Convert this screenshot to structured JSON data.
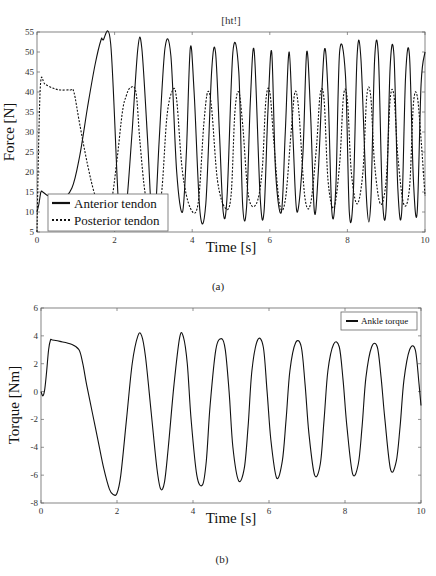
{
  "chart_data": [
    {
      "id": "a",
      "type": "line",
      "title": "[ht!]",
      "caption": "(a)",
      "xlabel": "Time [s]",
      "ylabel": "Force [N]",
      "xlim": [
        0,
        10
      ],
      "ylim": [
        5,
        55
      ],
      "xticks": [
        0,
        2,
        4,
        6,
        8,
        10
      ],
      "yticks": [
        5,
        10,
        15,
        20,
        25,
        30,
        35,
        40,
        45,
        50,
        55
      ],
      "grid": false,
      "legend_position": "lower left",
      "series": [
        {
          "name": "Anterior tendon",
          "style": "solid",
          "x": [
            0,
            0.05,
            0.1,
            0.15,
            0.3,
            0.6,
            0.9,
            1.1,
            1.3,
            1.5,
            1.65,
            1.7,
            1.9,
            2.1,
            2.2,
            2.3,
            2.45,
            2.6,
            2.7,
            2.85,
            2.95,
            3.05,
            3.15,
            3.3,
            3.45,
            3.6,
            3.75,
            3.85,
            3.95,
            4.05,
            4.2,
            4.35,
            4.5,
            4.6,
            4.7,
            4.8,
            4.9,
            5.05,
            5.2,
            5.3,
            5.4,
            5.5,
            5.6,
            5.75,
            5.85,
            5.95,
            6.05,
            6.15,
            6.3,
            6.4,
            6.5,
            6.6,
            6.7,
            6.85,
            6.95,
            7.05,
            7.15,
            7.25,
            7.4,
            7.5,
            7.6,
            7.7,
            7.8,
            7.95,
            8.05,
            8.15,
            8.25,
            8.35,
            8.5,
            8.6,
            8.7,
            8.8,
            8.9,
            9.0,
            9.1,
            9.2,
            9.3,
            9.4,
            9.5,
            9.6,
            9.7,
            9.8,
            9.9,
            10.0
          ],
          "values": [
            10,
            12,
            15,
            15,
            14,
            13,
            16,
            24,
            36,
            47,
            53,
            53,
            52,
            12,
            10,
            11,
            30,
            51,
            51,
            28,
            10,
            10,
            28,
            51,
            49,
            20,
            10,
            25,
            51,
            40,
            10,
            12,
            45,
            50,
            30,
            10,
            14,
            50,
            45,
            12,
            11,
            38,
            50,
            14,
            10,
            35,
            50,
            20,
            10,
            30,
            50,
            28,
            10,
            24,
            50,
            35,
            10,
            20,
            50,
            40,
            10,
            16,
            50,
            44,
            10,
            14,
            49,
            48,
            12,
            12,
            48,
            49,
            14,
            11,
            46,
            49,
            16,
            10,
            44,
            49,
            18,
            10,
            42,
            50
          ]
        },
        {
          "name": "Posterior tendon",
          "style": "dashed",
          "x": [
            0,
            0.05,
            0.1,
            0.2,
            0.4,
            0.6,
            0.85,
            0.95,
            1.1,
            1.3,
            1.5,
            1.7,
            1.9,
            2.05,
            2.2,
            2.3,
            2.4,
            2.55,
            2.65,
            2.8,
            3.0,
            3.2,
            3.35,
            3.5,
            3.6,
            3.75,
            3.95,
            4.15,
            4.3,
            4.4,
            4.5,
            4.65,
            4.85,
            5.0,
            5.1,
            5.2,
            5.3,
            5.45,
            5.65,
            5.8,
            5.9,
            6.0,
            6.1,
            6.25,
            6.4,
            6.55,
            6.65,
            6.75,
            6.9,
            7.05,
            7.2,
            7.3,
            7.4,
            7.5,
            7.65,
            7.8,
            7.9,
            8.0,
            8.1,
            8.25,
            8.4,
            8.5,
            8.6,
            8.7,
            8.85,
            9.0,
            9.1,
            9.2,
            9.3,
            9.45,
            9.6,
            9.7,
            9.8,
            9.9,
            10.0
          ],
          "values": [
            5,
            30,
            43,
            42,
            41,
            40.5,
            40.5,
            40,
            32,
            22,
            14,
            10,
            12,
            22,
            35,
            39,
            41,
            40,
            28,
            14,
            10,
            14,
            34,
            40.5,
            38,
            20,
            11,
            12,
            32,
            40,
            36,
            18,
            11,
            14,
            35,
            40,
            32,
            14,
            12,
            20,
            38,
            40,
            28,
            12,
            13,
            30,
            40,
            35,
            14,
            12,
            26,
            39.5,
            38,
            18,
            11,
            22,
            39,
            38,
            20,
            12,
            20,
            39,
            39,
            22,
            12,
            18,
            38,
            39,
            24,
            12,
            16,
            37,
            39,
            28,
            14
          ]
        }
      ]
    },
    {
      "id": "b",
      "type": "line",
      "title": "",
      "caption": "(b)",
      "xlabel": "Time [s]",
      "ylabel": "Torque [Nm]",
      "xlim": [
        0,
        10
      ],
      "ylim": [
        -8,
        6
      ],
      "xticks": [
        0,
        2,
        4,
        6,
        8,
        10
      ],
      "yticks": [
        -8,
        -6,
        -4,
        -2,
        0,
        2,
        4,
        6
      ],
      "grid": false,
      "legend_position": "upper right",
      "series": [
        {
          "name": "Ankle torque",
          "style": "solid",
          "x": [
            0,
            0.05,
            0.1,
            0.15,
            0.2,
            0.25,
            0.3,
            0.5,
            0.8,
            1.0,
            1.1,
            1.2,
            1.35,
            1.5,
            1.65,
            1.8,
            1.9,
            2.0,
            2.1,
            2.25,
            2.4,
            2.55,
            2.65,
            2.75,
            2.9,
            3.05,
            3.15,
            3.25,
            3.35,
            3.5,
            3.65,
            3.75,
            3.85,
            3.95,
            4.1,
            4.25,
            4.35,
            4.45,
            4.6,
            4.75,
            4.85,
            4.95,
            5.05,
            5.2,
            5.35,
            5.45,
            5.55,
            5.7,
            5.85,
            5.95,
            6.05,
            6.2,
            6.35,
            6.45,
            6.55,
            6.7,
            6.85,
            6.95,
            7.05,
            7.2,
            7.35,
            7.45,
            7.55,
            7.7,
            7.85,
            7.95,
            8.05,
            8.2,
            8.35,
            8.45,
            8.55,
            8.7,
            8.85,
            8.95,
            9.05,
            9.2,
            9.35,
            9.45,
            9.55,
            9.7,
            9.85,
            9.95,
            10.0
          ],
          "values": [
            0,
            -0.3,
            0.2,
            1.5,
            3.0,
            3.7,
            3.7,
            3.6,
            3.4,
            3.0,
            2.0,
            0.5,
            -1.5,
            -3.5,
            -5.5,
            -7.0,
            -7.4,
            -7.3,
            -6.0,
            -2.0,
            2.0,
            4.0,
            4.0,
            2.5,
            -1.5,
            -5.5,
            -7.0,
            -6.5,
            -4.0,
            0.5,
            3.9,
            3.9,
            2.0,
            -2.0,
            -6.0,
            -6.7,
            -5.0,
            -1.0,
            3.0,
            3.8,
            3.0,
            0.0,
            -4.0,
            -6.4,
            -5.5,
            -2.5,
            1.5,
            3.7,
            3.2,
            0.0,
            -3.5,
            -6.2,
            -5.0,
            -2.0,
            1.5,
            3.5,
            3.2,
            0.5,
            -3.0,
            -6.0,
            -5.2,
            -2.0,
            1.5,
            3.4,
            3.2,
            0.8,
            -2.5,
            -5.9,
            -5.2,
            -2.5,
            1.0,
            3.2,
            3.2,
            1.0,
            -2.0,
            -5.6,
            -5.0,
            -2.5,
            0.8,
            3.0,
            3.0,
            0.5,
            -1.0
          ]
        }
      ]
    }
  ],
  "figure": {
    "a": {
      "title": "[ht!]",
      "caption": "(a)",
      "xlabel": "Time [s]",
      "ylabel": "Force [N]",
      "legend": [
        "Anterior tendon",
        "Posterior tendon"
      ]
    },
    "b": {
      "caption": "(b)",
      "xlabel": "Time [s]",
      "ylabel": "Torque [Nm]",
      "legend": [
        "Ankle torque"
      ]
    }
  },
  "colors": {
    "line": "#111111",
    "axis": "#555555",
    "background": "#ffffff"
  }
}
